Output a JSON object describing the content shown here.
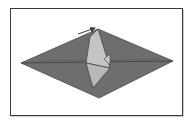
{
  "diagram": {
    "type": "origami-fold-step",
    "colors": {
      "paper_dark": "#6e6e6e",
      "paper_light": "#c4c4c4",
      "crease_line": "#3c3c3c",
      "frame": "#3a3a3a",
      "background": "#ffffff"
    },
    "shapes": {
      "diamond": "21,63 98,29 173,61 99,98",
      "flap_upper": "90,37 98,29 110,68 86,63",
      "flap_lower": "86,63 110,68 93,88",
      "tail": "104,59 110,54 110,65"
    },
    "arrow": {
      "x1": 78,
      "y1": 34,
      "x2": 95,
      "y2": 28,
      "meaning": "fold direction"
    }
  }
}
